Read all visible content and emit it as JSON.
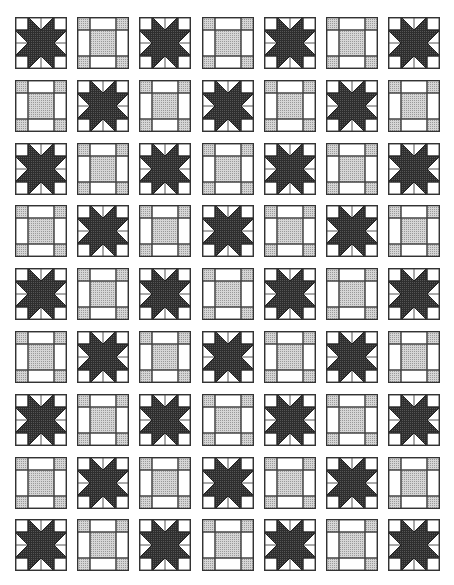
{
  "quilt": {
    "title": "",
    "rows": 9,
    "cols": 7,
    "block_size": 52,
    "col_step": 62.2,
    "row_step": 62.8,
    "pattern_rule": "star when (row+col) is even, square-in-square otherwise",
    "block_types": [
      "star",
      "square"
    ],
    "colors": {
      "star_fill": "#3a3a3a",
      "shade_fill": "#bdbdbd",
      "background": "#ffffff",
      "outline": "#333333"
    },
    "layout": [
      [
        "star",
        "square",
        "star",
        "square",
        "star",
        "square",
        "star"
      ],
      [
        "square",
        "star",
        "square",
        "star",
        "square",
        "star",
        "square"
      ],
      [
        "star",
        "square",
        "star",
        "square",
        "star",
        "square",
        "star"
      ],
      [
        "square",
        "star",
        "square",
        "star",
        "square",
        "star",
        "square"
      ],
      [
        "star",
        "square",
        "star",
        "square",
        "star",
        "square",
        "star"
      ],
      [
        "square",
        "star",
        "square",
        "star",
        "square",
        "star",
        "square"
      ],
      [
        "star",
        "square",
        "star",
        "square",
        "star",
        "square",
        "star"
      ],
      [
        "square",
        "star",
        "square",
        "star",
        "square",
        "star",
        "square"
      ],
      [
        "star",
        "square",
        "star",
        "square",
        "star",
        "square",
        "star"
      ]
    ]
  }
}
